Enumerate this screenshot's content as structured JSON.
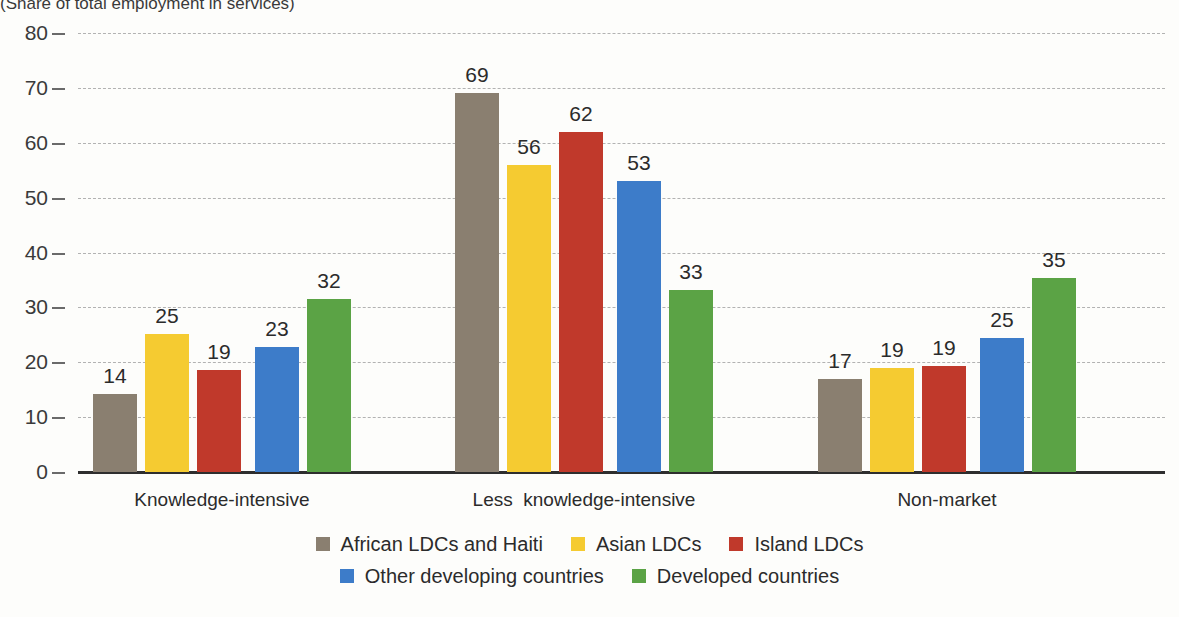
{
  "subtitle": "(Share of total employment in services)",
  "chart_data": {
    "type": "bar",
    "title": "",
    "subtitle": "(Share of total employment in services)",
    "xlabel": "",
    "ylabel": "",
    "ylim": [
      0,
      80
    ],
    "yticks": [
      0,
      10,
      20,
      30,
      40,
      50,
      60,
      70,
      80
    ],
    "grid": true,
    "legend_position": "bottom",
    "categories": [
      "Knowledge-intensive",
      "Less  knowledge-intensive",
      "Non-market"
    ],
    "series": [
      {
        "name": "African LDCs and Haiti",
        "color": "#8a7f70",
        "values": [
          14,
          69,
          17
        ],
        "plotted": [
          14.2,
          69.0,
          17.0
        ]
      },
      {
        "name": "Asian LDCs",
        "color": "#f5cb31",
        "values": [
          25,
          56,
          19
        ],
        "plotted": [
          25.1,
          56.0,
          19.0
        ]
      },
      {
        "name": "Island LDCs",
        "color": "#c0392b",
        "values": [
          19,
          62,
          19
        ],
        "plotted": [
          18.5,
          62.0,
          19.4
        ]
      },
      {
        "name": "Other developing countries",
        "color": "#3d7cc9",
        "values": [
          23,
          53,
          25
        ],
        "plotted": [
          22.7,
          53.0,
          24.5
        ]
      },
      {
        "name": "Developed countries",
        "color": "#5ba345",
        "values": [
          32,
          33,
          35
        ],
        "plotted": [
          31.6,
          33.1,
          35.3
        ]
      }
    ]
  },
  "colors": {
    "african": "#8a7f70",
    "asian": "#f5cb31",
    "island": "#c0392b",
    "other_developing": "#3d7cc9",
    "developed": "#5ba345",
    "gridline": "#9a9a9a",
    "axis": "#2e2e2e",
    "background": "#fdfdfb"
  }
}
